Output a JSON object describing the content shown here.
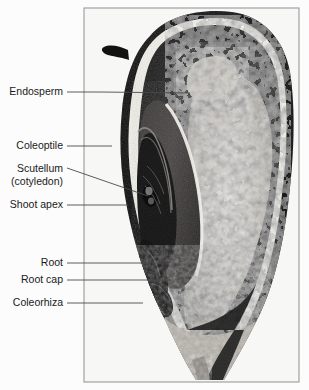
{
  "figure": {
    "caption": "",
    "background_color": "#fcfcfc",
    "frame": {
      "x": 83,
      "y": 7,
      "width": 217,
      "height": 376,
      "border_color": "#9a9a9a"
    },
    "image_kind": "grayscale-micrograph",
    "label_color": "#1a1a1a",
    "leader_color": "#4a4a4a"
  },
  "labels": [
    {
      "id": "endosperm",
      "text": "Endosperm",
      "icon": "label-leader-icon",
      "text_anchor_x": 63,
      "text_y": 95,
      "leader": "M 67 92 L 100 92 L 190 93",
      "target": "starchy endosperm tissue, upper central grain"
    },
    {
      "id": "coleoptile",
      "text": "Coleoptile",
      "icon": "label-leader-icon",
      "text_anchor_x": 63,
      "text_y": 149,
      "leader": "M 67 146 L 112 146",
      "target": "protective sheath over the shoot apex"
    },
    {
      "id": "scutellum",
      "text": "Scutellum",
      "icon": "label-leader-icon",
      "text_anchor_x": 63,
      "text_y": 172,
      "leader": "M 67 168 L 148 196",
      "target": "single cotyledon, shield-shaped absorptive organ"
    },
    {
      "id": "scutellum-sub",
      "text": "(cotyledon)",
      "icon": "label-subtext-icon",
      "text_anchor_x": 63,
      "text_y": 185,
      "leader": "",
      "target": ""
    },
    {
      "id": "shoot-apex",
      "text": "Shoot apex",
      "icon": "label-leader-icon",
      "text_anchor_x": 63,
      "text_y": 208,
      "leader": "M 67 205 L 128 205",
      "target": "apical meristem of the embryonic shoot"
    },
    {
      "id": "root",
      "text": "Root",
      "icon": "label-leader-icon",
      "text_anchor_x": 63,
      "text_y": 266,
      "leader": "M 67 263 L 163 263",
      "target": "embryonic radicle"
    },
    {
      "id": "root-cap",
      "text": "Root cap",
      "icon": "label-leader-icon",
      "text_anchor_x": 63,
      "text_y": 283,
      "leader": "M 67 280 L 171 280",
      "target": "calyptra protecting the root tip"
    },
    {
      "id": "coleorhiza",
      "text": "Coleorhiza",
      "icon": "label-leader-icon",
      "text_anchor_x": 63,
      "text_y": 306,
      "leader": "M 67 303 L 143 303",
      "target": "sheath enclosing the embryonic root"
    }
  ]
}
